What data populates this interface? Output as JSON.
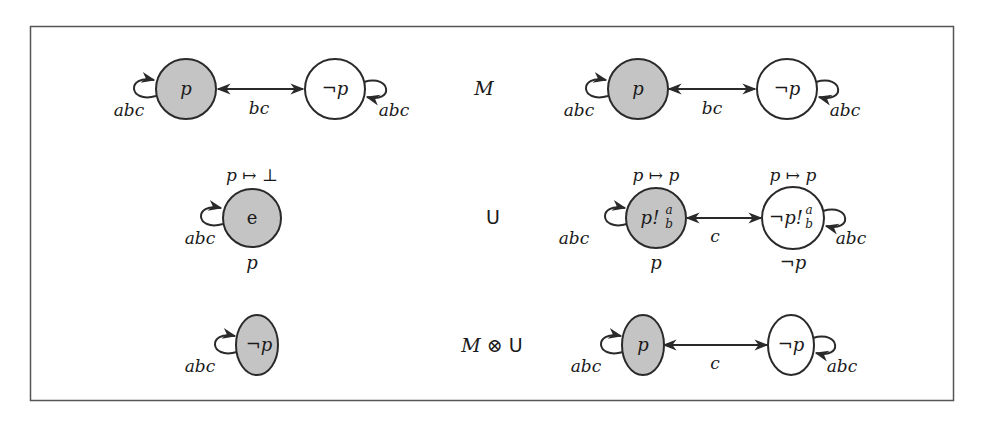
{
  "colors": {
    "stroke": "#2a2a2a",
    "designated_fill": "#c4c4c4",
    "plain_fill": "#ffffff",
    "frame": "#555555"
  },
  "rows": [
    {
      "left": {
        "nodes": [
          {
            "id": "l1a",
            "label": "p",
            "designated": true
          },
          {
            "id": "l1b",
            "label": "¬p",
            "designated": false
          }
        ],
        "edges": [
          {
            "from": "l1a",
            "to": "l1b",
            "label": "bc",
            "bidirectional": true
          }
        ],
        "loops": [
          {
            "node": "l1a",
            "label": "abc",
            "side": "left"
          },
          {
            "node": "l1b",
            "label": "abc",
            "side": "right"
          }
        ]
      },
      "name": "M",
      "right": {
        "nodes": [
          {
            "id": "r1a",
            "label": "p",
            "designated": true
          },
          {
            "id": "r1b",
            "label": "¬p",
            "designated": false
          }
        ],
        "edges": [
          {
            "from": "r1a",
            "to": "r1b",
            "label": "bc",
            "bidirectional": true
          }
        ],
        "loops": [
          {
            "node": "r1a",
            "label": "abc",
            "side": "left"
          },
          {
            "node": "r1b",
            "label": "abc",
            "side": "right"
          }
        ]
      }
    },
    {
      "left": {
        "nodes": [
          {
            "id": "l2a",
            "label": "e",
            "designated": true,
            "above": "p ↦ ⊥",
            "below": "p"
          }
        ],
        "loops": [
          {
            "node": "l2a",
            "label": "abc",
            "side": "left"
          }
        ]
      },
      "name": "U",
      "right": {
        "nodes": [
          {
            "id": "r2a",
            "label_base": "p!",
            "label_sup": "a",
            "label_sub": "b",
            "designated": true,
            "above": "p ↦ p",
            "below": "p"
          },
          {
            "id": "r2b",
            "label_base": "¬p!",
            "label_sup": "a",
            "label_sub": "b",
            "designated": false,
            "above": "p ↦ p",
            "below": "¬p"
          }
        ],
        "edges": [
          {
            "from": "r2a",
            "to": "r2b",
            "label": "c",
            "bidirectional": true
          }
        ],
        "loops": [
          {
            "node": "r2a",
            "label": "abc",
            "side": "left"
          },
          {
            "node": "r2b",
            "label": "abc",
            "side": "right"
          }
        ]
      }
    },
    {
      "left": {
        "nodes": [
          {
            "id": "l3a",
            "label": "¬p",
            "designated": true
          }
        ],
        "loops": [
          {
            "node": "l3a",
            "label": "abc",
            "side": "left"
          }
        ]
      },
      "name_italic": "M",
      "name_op": "⊗",
      "name_rest": "U",
      "right": {
        "nodes": [
          {
            "id": "r3a",
            "label": "p",
            "designated": true
          },
          {
            "id": "r3b",
            "label": "¬p",
            "designated": false
          }
        ],
        "edges": [
          {
            "from": "r3a",
            "to": "r3b",
            "label": "c",
            "bidirectional": true
          }
        ],
        "loops": [
          {
            "node": "r3a",
            "label": "abc",
            "side": "left"
          },
          {
            "node": "r3b",
            "label": "abc",
            "side": "right"
          }
        ]
      }
    }
  ]
}
